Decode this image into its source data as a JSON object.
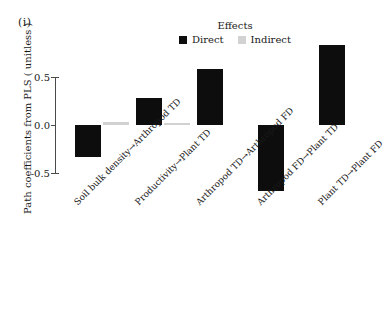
{
  "panel": {
    "tag": "(i)"
  },
  "legend": {
    "title": "Effects",
    "position": "top-center",
    "entries": [
      {
        "label": "Direct",
        "color": "#0d0d0d",
        "icon": "square-swatch"
      },
      {
        "label": "Indirect",
        "color": "#d2d2d2",
        "icon": "square-swatch"
      }
    ]
  },
  "axes": {
    "ylabel": "Path coefficients from PLS ( unitless )",
    "xlabel": "",
    "yticks": [
      "0.5",
      "0.0",
      "-0.5"
    ]
  },
  "chart_data": {
    "type": "bar",
    "title": "",
    "subtitle": "",
    "xlabel": "",
    "ylabel": "Path coefficients from PLS ( unitless )",
    "ylim": [
      -0.75,
      0.9
    ],
    "ytick_values": [
      0.5,
      0.0,
      -0.5
    ],
    "grid": false,
    "legend_position": "top-center",
    "orientation": "vertical",
    "categories": [
      "Soil bulk density→Arthropod TD",
      "Productivity→Plant TD",
      "Arthropod TD→Arthropod FD",
      "Arthropod FD→Plant TD",
      "Plant TD→Plant FD"
    ],
    "series": [
      {
        "name": "Direct",
        "color": "#0d0d0d",
        "values": [
          -0.33,
          0.28,
          0.58,
          -0.69,
          0.83
        ]
      },
      {
        "name": "Indirect",
        "color": "#d2d2d2",
        "values": [
          0.03,
          0.02,
          0.0,
          0.0,
          0.0
        ]
      }
    ],
    "annotations": [
      "(i)"
    ]
  }
}
